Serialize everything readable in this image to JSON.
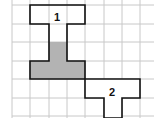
{
  "diagram": {
    "grid": {
      "x0": 12,
      "y0": 5,
      "cell": 18.4,
      "cols": 8,
      "rows": 7,
      "line_color": "#c8c8c8"
    },
    "shapes": [
      {
        "label": "1",
        "fill": "#ffffff",
        "stroke": "#111111"
      },
      {
        "label": "2",
        "fill": "#ffffff",
        "stroke": "#111111"
      }
    ],
    "shaded_fill": "#b3b3b3"
  }
}
